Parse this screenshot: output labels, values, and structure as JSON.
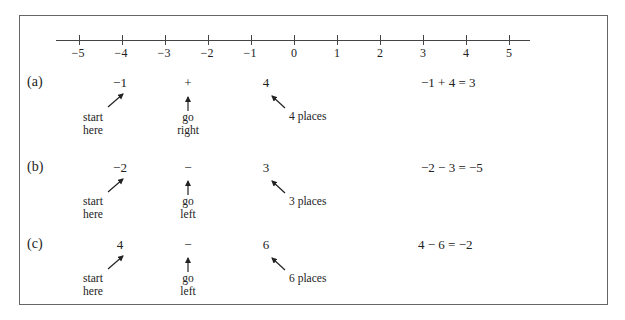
{
  "number_line": {
    "ticks": [
      "−5",
      "−4",
      "−3",
      "−2",
      "−1",
      "0",
      "1",
      "2",
      "3",
      "4",
      "5"
    ]
  },
  "examples": [
    {
      "label": "(a)",
      "start": "−1",
      "operator": "+",
      "amount": "4",
      "start_note_1": "start",
      "start_note_2": "here",
      "direction_note_1": "go",
      "direction_note_2": "right",
      "places_note": "4 places",
      "equation": "−1 + 4 = 3"
    },
    {
      "label": "(b)",
      "start": "−2",
      "operator": "−",
      "amount": "3",
      "start_note_1": "start",
      "start_note_2": "here",
      "direction_note_1": "go",
      "direction_note_2": "left",
      "places_note": "3 places",
      "equation": "−2 − 3 = −5"
    },
    {
      "label": "(c)",
      "start": "4",
      "operator": "−",
      "amount": "6",
      "start_note_1": "start",
      "start_note_2": "here",
      "direction_note_1": "go",
      "direction_note_2": "left",
      "places_note": "6 places",
      "equation": "4 − 6 = −2"
    }
  ]
}
